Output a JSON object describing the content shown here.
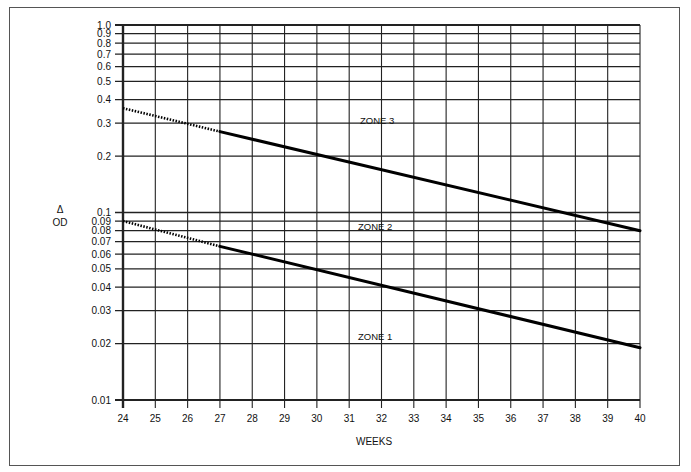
{
  "chart_data": {
    "type": "line",
    "title": "",
    "xlabel": "WEEKS",
    "ylabel": "ΔOD",
    "yscale": "log",
    "xlim": [
      24,
      40
    ],
    "ylim": [
      0.01,
      1.0
    ],
    "grid": true,
    "x_ticks": [
      24,
      25,
      26,
      27,
      28,
      29,
      30,
      31,
      32,
      33,
      34,
      35,
      36,
      37,
      38,
      39,
      40
    ],
    "y_ticks": [
      "0.01",
      "0.02",
      "0.03",
      "0.04",
      "0.05",
      "0.06",
      "0.07",
      "0.08",
      "0.09",
      "0.1",
      "0.2",
      "0.3",
      "0.4",
      "0.5",
      "0.6",
      "0.7",
      "0.8",
      "0.9",
      "1.0"
    ],
    "series": [
      {
        "name": "Zone 3 / Zone 2 boundary",
        "x": [
          24,
          27,
          40
        ],
        "y": [
          0.36,
          0.27,
          0.08
        ],
        "dotted_segment": [
          24,
          27
        ],
        "solid_segment": [
          27,
          40
        ]
      },
      {
        "name": "Zone 2 / Zone 1 boundary",
        "x": [
          24,
          27,
          40
        ],
        "y": [
          0.09,
          0.066,
          0.019
        ],
        "dotted_segment": [
          24,
          27
        ],
        "solid_segment": [
          27,
          40
        ]
      }
    ],
    "annotations": [
      {
        "text": "ZONE 3",
        "x": 32.5,
        "y": 0.27
      },
      {
        "text": "ZONE 2",
        "x": 32.5,
        "y": 0.088
      },
      {
        "text": "ZONE 1",
        "x": 32.5,
        "y": 0.021
      }
    ],
    "colors": {
      "line": "#000000",
      "grid": "#222222",
      "background": "#ffffff"
    }
  },
  "labels": {
    "xlabel": "WEEKS",
    "ylabel_top": "Δ",
    "ylabel_bottom": "OD",
    "zone3": "ZONE 3",
    "zone2": "ZONE 2",
    "zone1": "ZONE 1"
  }
}
